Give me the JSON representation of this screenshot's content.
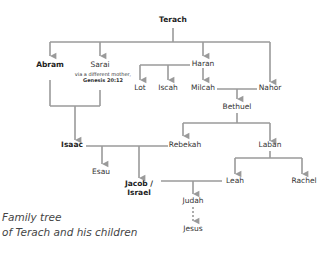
{
  "diagram": {
    "type": "family-tree",
    "line_color": "#9a9a9a",
    "text_color": "#333333",
    "caption": {
      "line1": "Family tree",
      "line2": "of Terach and his children"
    },
    "people": {
      "terach": {
        "name": "Terach",
        "emphasis": true
      },
      "abram": {
        "name": "Abram",
        "emphasis": true
      },
      "sarai": {
        "name": "Sarai",
        "emphasis": false,
        "note_line1": "via a different mother,",
        "note_line2": "Genesis 20:12"
      },
      "haran": {
        "name": "Haran",
        "emphasis": false
      },
      "nahor": {
        "name": "Nahor",
        "emphasis": false
      },
      "lot": {
        "name": "Lot",
        "emphasis": false
      },
      "iscah": {
        "name": "Iscah",
        "emphasis": false
      },
      "milcah": {
        "name": "Milcah",
        "emphasis": false
      },
      "bethuel": {
        "name": "Bethuel",
        "emphasis": false
      },
      "isaac": {
        "name": "Isaac",
        "emphasis": true
      },
      "rebekah": {
        "name": "Rebekah",
        "emphasis": false
      },
      "laban": {
        "name": "Laban",
        "emphasis": false
      },
      "esau": {
        "name": "Esau",
        "emphasis": false
      },
      "jacob": {
        "name_line1": "Jacob /",
        "name_line2": "Israel",
        "emphasis": true
      },
      "leah": {
        "name": "Leah",
        "emphasis": false
      },
      "rachel": {
        "name": "Rachel",
        "emphasis": false
      },
      "judah": {
        "name": "Judah",
        "emphasis": false
      },
      "jesus": {
        "name": "Jesus",
        "emphasis": false
      }
    },
    "relations": [
      {
        "type": "parent-child",
        "parent": "Terach",
        "children": [
          "Abram",
          "Sarai",
          "Haran",
          "Nahor"
        ]
      },
      {
        "type": "parent-child",
        "parent": "Haran",
        "children": [
          "Lot",
          "Iscah",
          "Milcah"
        ]
      },
      {
        "type": "marriage",
        "spouses": [
          "Milcah",
          "Nahor"
        ],
        "children": [
          "Bethuel"
        ]
      },
      {
        "type": "marriage",
        "spouses": [
          "Abram",
          "Sarai"
        ],
        "children": [
          "Isaac"
        ]
      },
      {
        "type": "parent-child",
        "parent": "Bethuel",
        "children": [
          "Rebekah",
          "Laban"
        ]
      },
      {
        "type": "marriage",
        "spouses": [
          "Isaac",
          "Rebekah"
        ],
        "children": [
          "Esau",
          "Jacob / Israel"
        ]
      },
      {
        "type": "parent-child",
        "parent": "Laban",
        "children": [
          "Leah",
          "Rachel"
        ]
      },
      {
        "type": "marriage",
        "spouses": [
          "Jacob / Israel",
          "Leah"
        ],
        "children": [
          "Judah"
        ]
      },
      {
        "type": "descent",
        "from": "Judah",
        "to": "Jesus",
        "style": "dashed"
      }
    ]
  }
}
